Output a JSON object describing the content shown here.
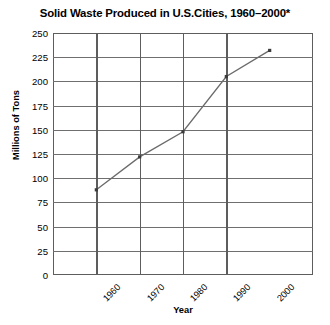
{
  "chart_data": {
    "type": "line",
    "title": "Solid Waste Produced in U.S.Cities, 1960–2000*",
    "xlabel": "Year",
    "ylabel": "Millions of Tons",
    "categories": [
      "1960",
      "1970",
      "1980",
      "1990",
      "2000"
    ],
    "x": [
      1960,
      1970,
      1980,
      1990,
      2000
    ],
    "values": [
      88,
      122,
      148,
      205,
      232
    ],
    "series": [
      {
        "name": "Solid waste produced",
        "values": [
          88,
          122,
          148,
          205,
          232
        ]
      }
    ],
    "ylim": [
      0,
      250
    ],
    "ytick_step": 25,
    "yticks": [
      250,
      225,
      200,
      175,
      150,
      125,
      100,
      75,
      50,
      25,
      0
    ],
    "xticks": [
      "1960",
      "1970",
      "1980",
      "1990",
      "2000"
    ],
    "grid": "horizontal-and-vertical",
    "legend": "none",
    "line_color": "#6b6b6b",
    "marker_color": "#3b3b3b",
    "marker": "square",
    "axis_color": "#5d5d5d",
    "background": "#ffffff",
    "xtick_rotation": -45
  }
}
